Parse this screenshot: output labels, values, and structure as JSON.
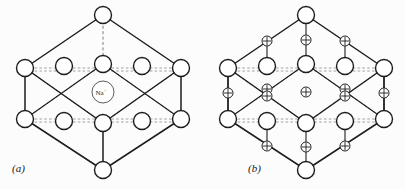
{
  "figure": {
    "background_color": "#fcfcfc",
    "line_color": "#1d1d1d",
    "dashed_line_color": "#6e6e6e",
    "ion_fill_color": "#ffffff"
  },
  "panels": [
    {
      "key": "a",
      "label": "(a)",
      "label_x": 12,
      "label_y": 172,
      "center_ion_label": "Na",
      "center_ion_charge": "+",
      "center_ion_x": 103,
      "center_ion_y": 92,
      "center_ion_r": 11,
      "large_ion_radius": 8.5,
      "large_ion_count": 14,
      "plus_ion_count": 0,
      "large_ions": [
        {
          "name": "top-vertex",
          "x": 103,
          "y": 15
        },
        {
          "name": "left-vertex",
          "x": 25,
          "y": 68
        },
        {
          "name": "right-vertex",
          "x": 181,
          "y": 68
        },
        {
          "name": "bottom-vertex",
          "x": 103,
          "y": 170
        },
        {
          "name": "upper-row-left",
          "x": 25,
          "y": 68
        },
        {
          "name": "upper-row-mid-left",
          "x": 64,
          "y": 66
        },
        {
          "name": "upper-row-center",
          "x": 103,
          "y": 64
        },
        {
          "name": "upper-row-mid-right",
          "x": 142,
          "y": 66
        },
        {
          "name": "upper-row-right",
          "x": 181,
          "y": 68
        },
        {
          "name": "lower-row-left",
          "x": 25,
          "y": 119
        },
        {
          "name": "lower-row-mid-left",
          "x": 64,
          "y": 121
        },
        {
          "name": "lower-row-center",
          "x": 103,
          "y": 123
        },
        {
          "name": "lower-row-mid-right",
          "x": 142,
          "y": 121
        },
        {
          "name": "lower-row-right",
          "x": 181,
          "y": 119
        }
      ],
      "plus_ions": []
    },
    {
      "key": "b",
      "label": "(b)",
      "label_x": 248,
      "label_y": 172,
      "center_ion_label": "",
      "center_ion_charge": "",
      "large_ion_radius": 8.5,
      "large_ion_count": 14,
      "plus_ion_radius": 5.0,
      "plus_ion_count": 13,
      "large_ions": [
        {
          "name": "top-vertex",
          "x": 306,
          "y": 15
        },
        {
          "name": "left-vertex",
          "x": 228,
          "y": 68
        },
        {
          "name": "right-vertex",
          "x": 384,
          "y": 68
        },
        {
          "name": "bottom-vertex",
          "x": 306,
          "y": 170
        },
        {
          "name": "upper-row-mid-left",
          "x": 267,
          "y": 66
        },
        {
          "name": "upper-row-center",
          "x": 306,
          "y": 64
        },
        {
          "name": "upper-row-mid-right",
          "x": 345,
          "y": 66
        },
        {
          "name": "lower-row-left",
          "x": 228,
          "y": 119
        },
        {
          "name": "lower-row-mid-left",
          "x": 267,
          "y": 121
        },
        {
          "name": "lower-row-center",
          "x": 306,
          "y": 123
        },
        {
          "name": "lower-row-mid-right",
          "x": 345,
          "y": 121
        },
        {
          "name": "lower-row-right",
          "x": 384,
          "y": 119
        }
      ],
      "plus_ions": [
        {
          "name": "top-left",
          "x": 267,
          "y": 41
        },
        {
          "name": "top-center",
          "x": 306,
          "y": 40
        },
        {
          "name": "top-right",
          "x": 345,
          "y": 41
        },
        {
          "name": "mid-far-left",
          "x": 228,
          "y": 93
        },
        {
          "name": "mid-inner-left-upper",
          "x": 267,
          "y": 89
        },
        {
          "name": "mid-inner-left-lower",
          "x": 267,
          "y": 96
        },
        {
          "name": "mid-center",
          "x": 306,
          "y": 92
        },
        {
          "name": "mid-inner-right-upper",
          "x": 345,
          "y": 89
        },
        {
          "name": "mid-inner-right-lower",
          "x": 345,
          "y": 96
        },
        {
          "name": "mid-far-right",
          "x": 384,
          "y": 93
        },
        {
          "name": "bottom-left",
          "x": 267,
          "y": 146
        },
        {
          "name": "bottom-center",
          "x": 306,
          "y": 147
        },
        {
          "name": "bottom-right",
          "x": 345,
          "y": 146
        }
      ]
    }
  ]
}
